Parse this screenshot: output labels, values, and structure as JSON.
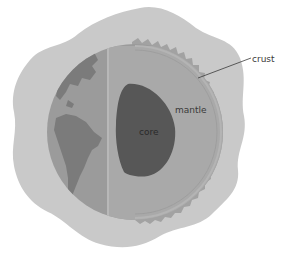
{
  "diagram": {
    "labels": {
      "crust": "crust",
      "mantle": "mantle",
      "core": "core"
    },
    "colors": {
      "background": "#ffffff",
      "atmosphere": "#c9c9c9",
      "ocean": "#9b9b9b",
      "continents": "#7b7b7b",
      "mantle": "#a9a9a9",
      "crust": "#a2a2a2",
      "core": "#575757",
      "leader_line": "#3a3a3a"
    }
  }
}
